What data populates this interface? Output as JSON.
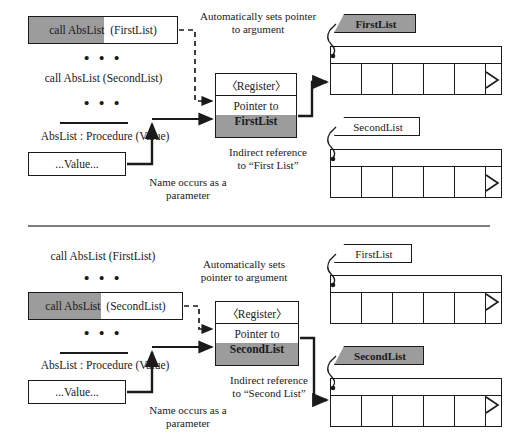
{
  "diagram": {
    "shade_color": "#9c9c9c",
    "line_color": "#1a1a1a"
  },
  "panels": [
    {
      "id": "top",
      "calls": {
        "boxed": {
          "prefix": "call AbsList",
          "arg": "(FirstList)",
          "highlighted": true
        },
        "plain": {
          "text": "call AbsList (SecondList)"
        },
        "dots_upper": "• • •",
        "dots_lower": "• • •"
      },
      "procedure_header": "AbsList : Procedure (Value)",
      "value_box": "...Value...",
      "annotations": {
        "auto_sets": "Automatically sets pointer",
        "auto_sets_2": "to argument",
        "name_occurs": "Name occurs as a",
        "name_occurs_2": "parameter",
        "indirect": "Indirect reference",
        "indirect_2": "to “First List”"
      },
      "register": {
        "header": "〈Register〉",
        "line1": "Pointer to",
        "line2": "FirstList"
      },
      "lists": [
        {
          "label": "FirstList",
          "highlighted": true,
          "cells": 5,
          "pointed": true
        },
        {
          "label": "SecondList",
          "highlighted": false,
          "cells": 5,
          "pointed": false
        }
      ]
    },
    {
      "id": "bottom",
      "calls": {
        "plain": {
          "text": "call AbsList (FirstList)"
        },
        "boxed": {
          "prefix": "call AbsList",
          "arg": "(SecondList)",
          "highlighted": true
        },
        "dots_upper": "• • •",
        "dots_lower": "• • •"
      },
      "procedure_header": "AbsList : Procedure (Value)",
      "value_box": "...Value...",
      "annotations": {
        "auto_sets": "Automatically sets",
        "auto_sets_2": "pointer to argument",
        "name_occurs": "Name occurs as a",
        "name_occurs_2": "parameter",
        "indirect": "Indirect reference",
        "indirect_2": "to “Second List”"
      },
      "register": {
        "header": "〈Register〉",
        "line1": "Pointer to",
        "line2": "SecondList"
      },
      "lists": [
        {
          "label": "FirstList",
          "highlighted": false,
          "cells": 5,
          "pointed": false
        },
        {
          "label": "SecondList",
          "highlighted": true,
          "cells": 5,
          "pointed": true
        }
      ]
    }
  ]
}
